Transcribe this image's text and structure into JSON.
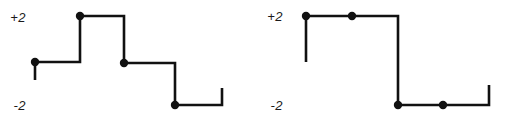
{
  "figure": {
    "background_color": "#ffffff",
    "stroke_color": "#111111",
    "line_width": 2.6,
    "dot_radius": 4.2,
    "width": 507,
    "height": 122
  },
  "panels": [
    {
      "id": "left-waveform",
      "name": "quantized-staircase-signal-left",
      "labels": {
        "top": "+2",
        "bottom": "-2",
        "top_position": {
          "x": 26,
          "y": 22
        },
        "bottom_position": {
          "x": 26,
          "y": 110
        }
      },
      "levels": {
        "plus_two_y": 16,
        "minus_two_y": 105,
        "level_plus1_y": 62,
        "level_0_y": 88
      },
      "polyline": "35,62 80,62 80,16 124,16 124,63 175,63 175,105 222,105 222,88",
      "lead_in": {
        "x": 35,
        "y1": 62,
        "y2": 80
      },
      "samples": [
        {
          "x": 35,
          "y": 62,
          "label": "sample-1"
        },
        {
          "x": 80,
          "y": 16,
          "label": "sample-2"
        },
        {
          "x": 124,
          "y": 63,
          "label": "sample-3"
        },
        {
          "x": 175,
          "y": 105,
          "label": "sample-4"
        }
      ]
    },
    {
      "id": "right-waveform",
      "name": "quantized-staircase-signal-right",
      "labels": {
        "top": "+2",
        "bottom": "-2",
        "top_position": {
          "x": 283,
          "y": 21
        },
        "bottom_position": {
          "x": 283,
          "y": 110
        }
      },
      "levels": {
        "plus_two_y": 16,
        "minus_two_y": 105,
        "level_plus1_y": 62,
        "level_0_y": 85
      },
      "polyline": "306,16 398,16 398,105 489,105 489,85",
      "lead_in": {
        "x": 306,
        "y1": 16,
        "y2": 62
      },
      "samples": [
        {
          "x": 306,
          "y": 16,
          "label": "sample-1"
        },
        {
          "x": 352,
          "y": 16,
          "label": "sample-2"
        },
        {
          "x": 398,
          "y": 105,
          "label": "sample-3"
        },
        {
          "x": 443,
          "y": 105,
          "label": "sample-4"
        }
      ]
    }
  ],
  "chart_data": {
    "type": "line",
    "title": "",
    "xlabel": "",
    "ylabel": "",
    "ylim": [
      -2,
      2
    ],
    "grid": false,
    "legend": "none",
    "annotations": [
      "+2",
      "-2",
      "+2",
      "-2"
    ],
    "series": [
      {
        "name": "left-staircase",
        "step": "post",
        "x": [
          0,
          1,
          2,
          3
        ],
        "values": [
          0,
          2,
          -0.1,
          -2
        ],
        "tick_labels": [
          "+2",
          "-2"
        ]
      },
      {
        "name": "right-staircase",
        "step": "post",
        "x": [
          0,
          1,
          2,
          3
        ],
        "values": [
          2,
          2,
          -2,
          -2
        ],
        "tick_labels": [
          "+2",
          "-2"
        ]
      }
    ]
  }
}
